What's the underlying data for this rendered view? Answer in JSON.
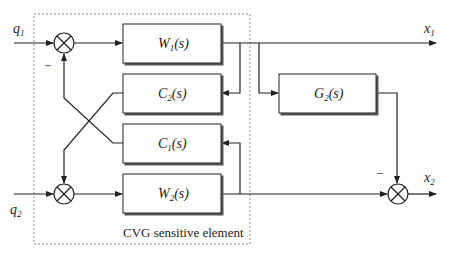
{
  "diagram": {
    "inputs": {
      "q1": "q",
      "q1_sub": "1",
      "q2": "q",
      "q2_sub": "2"
    },
    "outputs": {
      "x1": "x",
      "x1_sub": "1",
      "x2": "x",
      "x2_sub": "2"
    },
    "blocks": {
      "W1": {
        "name": "W",
        "sub": "1",
        "arg": "(s)"
      },
      "C2": {
        "name": "C",
        "sub": "2",
        "arg": "(s)"
      },
      "C1": {
        "name": "C",
        "sub": "1",
        "arg": "(s)"
      },
      "W2": {
        "name": "W",
        "sub": "2",
        "arg": "(s)"
      },
      "G2": {
        "name": "G",
        "sub": "2",
        "arg": "(s)"
      }
    },
    "signs": {
      "sum1_minus": "−",
      "sum3_minus": "−"
    },
    "group_caption": "CVG sensitive element"
  }
}
